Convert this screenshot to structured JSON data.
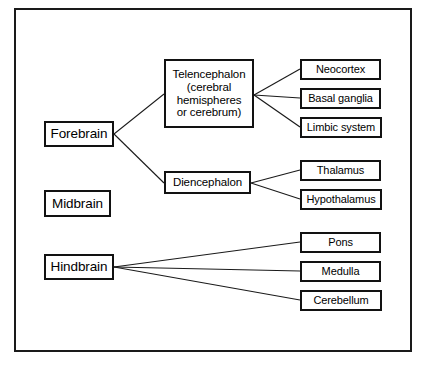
{
  "diagram": {
    "type": "hierarchy-tree",
    "frame": {
      "border_color": "#1a1a1a"
    },
    "nodes": {
      "forebrain": {
        "label": "Forebrain",
        "level": 1
      },
      "midbrain": {
        "label": "Midbrain",
        "level": 1
      },
      "hindbrain": {
        "label": "Hindbrain",
        "level": 1
      },
      "telencephalon": {
        "label": "Telencephalon\n(cerebral\nhemispheres\nor cerebrum)",
        "level": 2
      },
      "diencephalon": {
        "label": "Diencephalon",
        "level": 2
      },
      "neocortex": {
        "label": "Neocortex",
        "level": 3
      },
      "basal_ganglia": {
        "label": "Basal ganglia",
        "level": 3
      },
      "limbic_system": {
        "label": "Limbic system",
        "level": 3
      },
      "thalamus": {
        "label": "Thalamus",
        "level": 3
      },
      "hypothalamus": {
        "label": "Hypothalamus",
        "level": 3
      },
      "pons": {
        "label": "Pons",
        "level": 3
      },
      "medulla": {
        "label": "Medulla",
        "level": 3
      },
      "cerebellum": {
        "label": "Cerebellum",
        "level": 3
      }
    },
    "edges": [
      {
        "from": "forebrain",
        "to": "telencephalon"
      },
      {
        "from": "forebrain",
        "to": "diencephalon"
      },
      {
        "from": "telencephalon",
        "to": "neocortex"
      },
      {
        "from": "telencephalon",
        "to": "basal_ganglia"
      },
      {
        "from": "telencephalon",
        "to": "limbic_system"
      },
      {
        "from": "diencephalon",
        "to": "thalamus"
      },
      {
        "from": "diencephalon",
        "to": "hypothalamus"
      },
      {
        "from": "hindbrain",
        "to": "pons"
      },
      {
        "from": "hindbrain",
        "to": "medulla"
      },
      {
        "from": "hindbrain",
        "to": "cerebellum"
      }
    ]
  }
}
